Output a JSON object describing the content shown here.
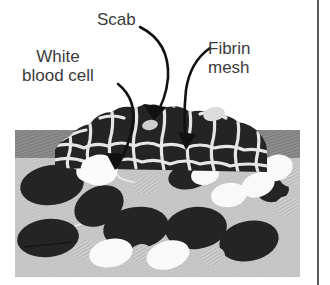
{
  "figure": {
    "labels": {
      "scab": "Scab",
      "white_blood_cell_line1": "White",
      "white_blood_cell_line2": "blood cell",
      "fibrin_line1": "Fibrin",
      "fibrin_line2": "mesh"
    },
    "colors": {
      "background": "#ffffff",
      "text": "#3b3b3b",
      "arrow": "#111111",
      "epidermis_band": "#8a8a8a",
      "dermis_field": "#c6c6c6",
      "red_blood_cell": "#242424",
      "white_blood_cell": "#f7f7f7",
      "platelet": "#b0b0b0",
      "fibrin_strand": "#e8e8e8",
      "border_rule": "#5b5b5b"
    },
    "panel": {
      "x": 15,
      "y": 130,
      "width": 285,
      "height": 147
    },
    "epidermis_band": {
      "x": 15,
      "y": 130,
      "width": 285,
      "height": 28
    },
    "scab_mound": {
      "x": 55,
      "y": 104,
      "width": 212,
      "height": 66
    },
    "red_blood_cells": [
      {
        "cx": 52,
        "cy": 185,
        "rx": 32,
        "ry": 20,
        "rot": -8
      },
      {
        "cx": 48,
        "cy": 238,
        "rx": 31,
        "ry": 19,
        "rot": -6
      },
      {
        "cx": 99,
        "cy": 206,
        "rx": 26,
        "ry": 19,
        "rot": -28
      },
      {
        "cx": 136,
        "cy": 228,
        "rx": 33,
        "ry": 21,
        "rot": -8
      },
      {
        "cx": 196,
        "cy": 228,
        "rx": 31,
        "ry": 21,
        "rot": -6
      },
      {
        "cx": 249,
        "cy": 241,
        "rx": 30,
        "ry": 20,
        "rot": -12
      },
      {
        "cx": 190,
        "cy": 176,
        "rx": 22,
        "ry": 13,
        "rot": -12
      },
      {
        "cx": 273,
        "cy": 190,
        "rx": 16,
        "ry": 12,
        "rot": -10
      }
    ],
    "white_blood_cells": [
      {
        "cx": 93,
        "cy": 170,
        "rx": 17,
        "ry": 12,
        "rot": -14
      },
      {
        "cx": 111,
        "cy": 253,
        "rx": 22,
        "ry": 14,
        "rot": -12
      },
      {
        "cx": 168,
        "cy": 255,
        "rx": 22,
        "ry": 14,
        "rot": -16
      },
      {
        "cx": 205,
        "cy": 175,
        "rx": 14,
        "ry": 10,
        "rot": -10
      },
      {
        "cx": 229,
        "cy": 195,
        "rx": 18,
        "ry": 12,
        "rot": -8
      },
      {
        "cx": 258,
        "cy": 185,
        "rx": 17,
        "ry": 12,
        "rot": -20
      },
      {
        "cx": 276,
        "cy": 168,
        "rx": 17,
        "ry": 13,
        "rot": -18
      }
    ],
    "platelets": [
      {
        "cx": 146,
        "cy": 185,
        "rx": 13,
        "ry": 9,
        "rot": -14
      },
      {
        "cx": 85,
        "cy": 250,
        "rx": 12,
        "ry": 10,
        "rot": -8
      },
      {
        "cx": 141,
        "cy": 253,
        "rx": 11,
        "ry": 9,
        "rot": -10
      },
      {
        "cx": 213,
        "cy": 256,
        "rx": 12,
        "ry": 9,
        "rot": -10
      },
      {
        "cx": 290,
        "cy": 175,
        "rx": 11,
        "ry": 12,
        "rot": -6
      },
      {
        "cx": 287,
        "cy": 206,
        "rx": 12,
        "ry": 10,
        "rot": -8
      }
    ],
    "annotations": [
      {
        "name": "scab",
        "arrow": "curved-down-left"
      },
      {
        "name": "white-blood-cell",
        "arrow": "long-curve-down"
      },
      {
        "name": "fibrin-mesh",
        "arrow": "curved-down-right"
      }
    ]
  }
}
